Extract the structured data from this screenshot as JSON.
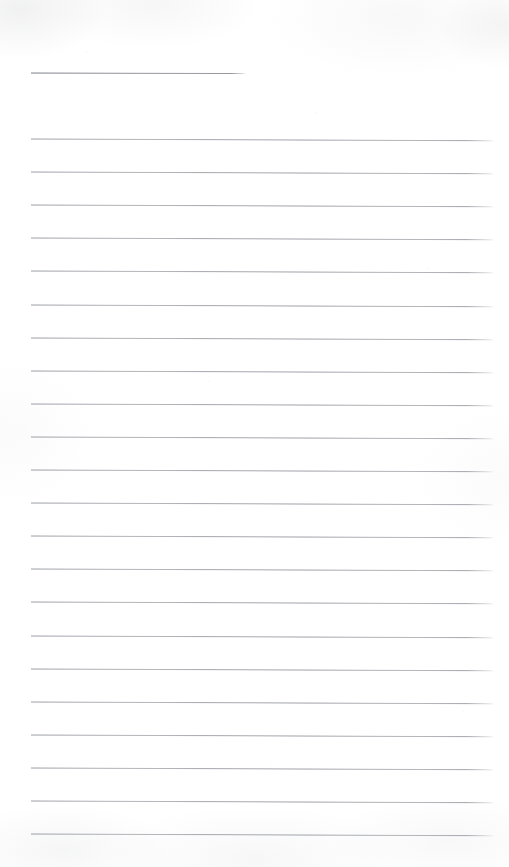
{
  "document": {
    "kind": "scanned-ruled-notepaper",
    "page_label": "",
    "title_text": "",
    "body_text": "",
    "width_px": 509,
    "height_px": 867,
    "background_color": "#ffffff",
    "rule_color": "#96989e",
    "rule_thickness_px": 1
  },
  "title_rule": {
    "name": "title-underline",
    "x_start": 31,
    "x_end": 245,
    "y": 72,
    "slope_deg": 0.15
  },
  "ruled_lines": {
    "count": 22,
    "x_start": 31,
    "x_end": 493,
    "y_first": 138,
    "y_last": 833,
    "spacing_px": 33.1,
    "slope_deg": 0.22,
    "y_positions": [
      138,
      171.1,
      204.2,
      237.3,
      270.4,
      303.5,
      336.6,
      369.7,
      402.8,
      435.9,
      469,
      502.1,
      535.2,
      568.3,
      601.4,
      634.5,
      667.6,
      700.7,
      733.8,
      766.9,
      800,
      833.1
    ]
  }
}
